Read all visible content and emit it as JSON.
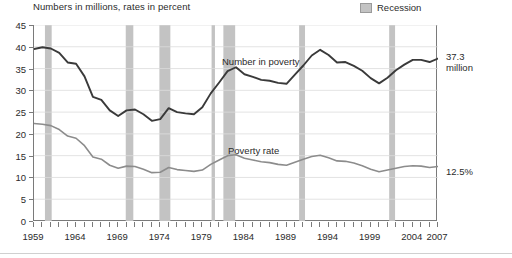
{
  "subtitle": "Numbers in millions, rates in percent",
  "legend": {
    "recession_label": "Recession",
    "recession_color": "#c3c3c3"
  },
  "annotations": {
    "number_series_label": "Number in poverty",
    "rate_series_label": "Poverty rate",
    "end_number_value": "37.3\nmillion",
    "end_rate_value": "12.5%"
  },
  "colors": {
    "number_line": "#3a3a3a",
    "rate_line": "#8c8c8c",
    "grid": "#dcdcdc",
    "axis": "#7a7a7a",
    "recession_band": "#c3c3c3"
  },
  "chart_data": {
    "type": "line",
    "title": "",
    "subtitle": "Numbers in millions, rates in percent",
    "xlabel": "",
    "ylabel": "",
    "xlim": [
      1959,
      2007
    ],
    "ylim": [
      0,
      45
    ],
    "ytick_step": 5,
    "yticks": [
      0,
      5,
      10,
      15,
      20,
      25,
      30,
      35,
      40,
      45
    ],
    "xticks_labeled": [
      1959,
      1964,
      1969,
      1974,
      1979,
      1984,
      1989,
      1994,
      1999,
      2004,
      2007
    ],
    "xtick_minor_every": 1,
    "grid": true,
    "legend_position": "top-right",
    "x": [
      1959,
      1960,
      1961,
      1962,
      1963,
      1964,
      1965,
      1966,
      1967,
      1968,
      1969,
      1970,
      1971,
      1972,
      1973,
      1974,
      1975,
      1976,
      1977,
      1978,
      1979,
      1980,
      1981,
      1982,
      1983,
      1984,
      1985,
      1986,
      1987,
      1988,
      1989,
      1990,
      1991,
      1992,
      1993,
      1994,
      1995,
      1996,
      1997,
      1998,
      1999,
      2000,
      2001,
      2002,
      2003,
      2004,
      2005,
      2006,
      2007
    ],
    "series": [
      {
        "name": "Number in poverty",
        "units": "millions",
        "color": "#3a3a3a",
        "values": [
          39.5,
          39.9,
          39.6,
          38.6,
          36.4,
          36.1,
          33.2,
          28.5,
          27.8,
          25.4,
          24.1,
          25.4,
          25.6,
          24.5,
          23.0,
          23.4,
          25.9,
          25.0,
          24.7,
          24.5,
          26.1,
          29.3,
          31.8,
          34.4,
          35.3,
          33.7,
          33.1,
          32.4,
          32.2,
          31.7,
          31.5,
          33.6,
          35.7,
          38.0,
          39.3,
          38.1,
          36.4,
          36.5,
          35.6,
          34.5,
          32.8,
          31.6,
          32.9,
          34.6,
          35.9,
          37.0,
          37.0,
          36.5,
          37.3
        ]
      },
      {
        "name": "Poverty rate",
        "units": "percent",
        "color": "#8c8c8c",
        "values": [
          22.4,
          22.2,
          21.9,
          21.0,
          19.5,
          19.0,
          17.3,
          14.7,
          14.2,
          12.8,
          12.1,
          12.6,
          12.5,
          11.9,
          11.1,
          11.2,
          12.3,
          11.8,
          11.6,
          11.4,
          11.7,
          13.0,
          14.0,
          15.0,
          15.2,
          14.4,
          14.0,
          13.6,
          13.4,
          13.0,
          12.8,
          13.5,
          14.2,
          14.8,
          15.1,
          14.5,
          13.8,
          13.7,
          13.3,
          12.7,
          11.9,
          11.3,
          11.7,
          12.1,
          12.5,
          12.7,
          12.6,
          12.3,
          12.5
        ]
      }
    ],
    "recessions": [
      {
        "start": 1960.3,
        "end": 1961.1
      },
      {
        "start": 1969.9,
        "end": 1970.8
      },
      {
        "start": 1973.9,
        "end": 1975.2
      },
      {
        "start": 1980.1,
        "end": 1980.5
      },
      {
        "start": 1981.5,
        "end": 1982.9
      },
      {
        "start": 1990.5,
        "end": 1991.2
      },
      {
        "start": 2001.2,
        "end": 2001.9
      }
    ]
  }
}
